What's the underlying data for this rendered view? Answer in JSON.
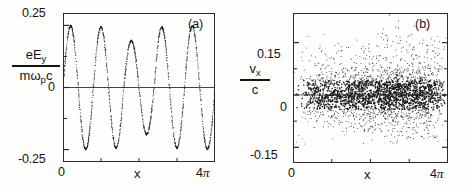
{
  "figure": {
    "background": "#fdfdfc",
    "ink": "#141414"
  },
  "panel_a": {
    "tag": "(a)",
    "ylabel_num": "eE",
    "ylabel_num_sub": "y",
    "ylabel_den": "mω",
    "ylabel_den_sub": "p",
    "ylabel_den_tail": "c",
    "xlabel": "x",
    "ytick_top": "0.25",
    "ytick_mid": "0",
    "ytick_bottom": "-0.25",
    "xtick_left": "0",
    "xtick_right_num": "4",
    "xtick_right_sym": "π"
  },
  "panel_b": {
    "tag": "(b)",
    "ylabel_num": "v",
    "ylabel_num_sub": "x",
    "ylabel_den": "c",
    "xlabel": "x",
    "ytick_top": "0.15",
    "ytick_mid": "0",
    "ytick_bottom": "-0.15",
    "xtick_left": "0",
    "xtick_right_num": "4",
    "xtick_right_sym": "π"
  },
  "chart_data": [
    {
      "type": "scatter",
      "id": "panel-a-wave",
      "title": "(a)",
      "xlabel": "x",
      "ylabel": "eE_y / (m omega_p c)",
      "xlim": [
        0,
        12.566370614
      ],
      "ylim": [
        -0.3,
        0.3
      ],
      "xtick_values": [
        0,
        12.566370614
      ],
      "xtick_labels": [
        "0",
        "4π"
      ],
      "ytick_values": [
        0.25,
        0,
        -0.25
      ],
      "ytick_labels": [
        "0.25",
        "0",
        "-0.25"
      ],
      "grid": false,
      "legend": "none",
      "zero_line": true,
      "marker": "dot",
      "description": "Dotted sinusoidal electric-field waveform, roughly four cycles across 0 to 4 pi, amplitude near 0.25 with a dip to about 0.19 on the third crest.",
      "cycles": 4,
      "amplitude_envelope": [
        0.25,
        0.245,
        0.19,
        0.245
      ],
      "series": [
        {
          "name": "eEy/(m wp c)",
          "x": [
            0.0,
            0.13,
            0.25,
            0.38,
            0.5,
            0.63,
            0.75,
            0.88,
            1.01,
            1.13,
            1.26,
            1.38,
            1.51,
            1.63,
            1.76,
            1.88,
            2.01,
            2.14,
            2.26,
            2.39,
            2.51,
            2.64,
            2.76,
            2.89,
            3.02,
            3.14,
            3.27,
            3.39,
            3.52,
            3.64,
            3.77,
            3.9,
            4.02,
            4.15,
            4.27,
            4.4,
            4.52,
            4.65,
            4.78,
            4.9,
            5.03,
            5.15,
            5.28,
            5.4,
            5.53,
            5.65,
            5.78,
            5.91,
            6.03,
            6.16,
            6.28,
            6.41,
            6.53,
            6.66,
            6.79,
            6.91,
            7.04,
            7.16,
            7.29,
            7.41,
            7.54,
            7.67,
            7.79,
            7.92,
            8.04,
            8.17,
            8.29,
            8.42,
            8.55,
            8.67,
            8.8,
            8.92,
            9.05,
            9.17,
            9.3,
            9.42,
            9.55,
            9.68,
            9.8,
            9.93,
            10.05,
            10.18,
            10.3,
            10.43,
            10.56,
            10.68,
            10.81,
            10.93,
            11.06,
            11.18,
            11.31,
            11.44,
            11.56,
            11.69,
            11.81,
            11.94,
            12.06,
            12.19,
            12.32,
            12.44,
            12.57
          ],
          "y": [
            0.0,
            0.077,
            0.147,
            0.203,
            0.238,
            0.25,
            0.238,
            0.203,
            0.147,
            0.077,
            0.0,
            -0.077,
            -0.147,
            -0.203,
            -0.238,
            -0.25,
            -0.238,
            -0.203,
            -0.147,
            -0.077,
            0.0,
            0.075,
            0.144,
            0.199,
            0.233,
            0.245,
            0.233,
            0.199,
            0.144,
            0.075,
            0.0,
            -0.075,
            -0.144,
            -0.199,
            -0.233,
            -0.245,
            -0.233,
            -0.199,
            -0.144,
            -0.075,
            0.0,
            0.059,
            0.112,
            0.154,
            0.181,
            0.19,
            0.181,
            0.154,
            0.112,
            0.059,
            0.0,
            -0.059,
            -0.112,
            -0.154,
            -0.181,
            -0.19,
            -0.181,
            -0.154,
            -0.112,
            -0.059,
            0.0,
            0.075,
            0.144,
            0.199,
            0.233,
            0.245,
            0.233,
            0.199,
            0.144,
            0.075,
            0.0,
            -0.075,
            -0.144,
            -0.199,
            -0.233,
            -0.245,
            -0.233,
            -0.199,
            -0.144,
            -0.075,
            0.0,
            0.077,
            0.147,
            0.203,
            0.238,
            0.25,
            0.238,
            0.203,
            0.147,
            0.077,
            0.0,
            -0.077,
            -0.147,
            -0.203,
            -0.238,
            -0.25,
            -0.238,
            -0.203,
            -0.147,
            -0.077,
            0.0
          ]
        }
      ]
    },
    {
      "type": "scatter",
      "id": "panel-b-phase",
      "title": "(b)",
      "xlabel": "x",
      "ylabel": "v_x / c",
      "xlim": [
        0,
        12.566370614
      ],
      "ylim": [
        -0.195,
        0.235
      ],
      "xtick_values": [
        0,
        12.566370614
      ],
      "xtick_labels": [
        "0",
        "4π"
      ],
      "ytick_values": [
        0.15,
        0,
        -0.15
      ],
      "ytick_labels": [
        "0.15",
        "0",
        "-0.15"
      ],
      "grid": false,
      "legend": "none",
      "zero_line": true,
      "marker": "dot",
      "n_points": 2600,
      "description": "Dense particle phase-space scatter of v_x/c versus x showing four vertical clumps (bunches) of increasing height, centered on zero with spread growing toward larger x; tallest spikes reach about 0.2.",
      "bunch_centers": [
        2.6,
        5.3,
        7.9,
        10.4
      ],
      "bunch_spike_heights": [
        0.13,
        0.15,
        0.2,
        0.18
      ],
      "core_spread": 0.035
    }
  ]
}
